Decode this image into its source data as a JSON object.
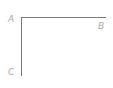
{
  "diagram": {
    "type": "right-angle",
    "points": [
      {
        "id": "A",
        "label": "A",
        "x": 21,
        "y": 17
      },
      {
        "id": "B",
        "label": "B",
        "x": 106,
        "y": 17
      },
      {
        "id": "C",
        "label": "C",
        "x": 21,
        "y": 76
      }
    ],
    "segments": [
      {
        "from": "A",
        "to": "B"
      },
      {
        "from": "A",
        "to": "C"
      }
    ],
    "line_color": "#7a7a7a",
    "label_color": "#aaaaaa"
  }
}
